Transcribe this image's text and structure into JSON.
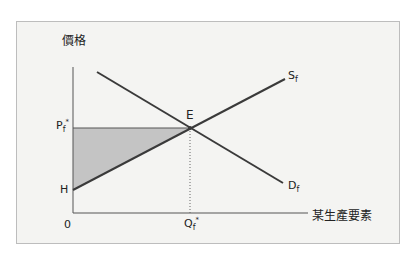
{
  "diagram": {
    "y_axis_label": "價格",
    "x_axis_label": "某生產要素",
    "origin_label": "0",
    "price_label": {
      "main": "P",
      "sub": "f",
      "sup": "*"
    },
    "quantity_label": {
      "main": "Q",
      "sub": "f",
      "sup": "*"
    },
    "intercept_label": "H",
    "equilibrium_label": "E",
    "supply_label": {
      "main": "S",
      "sub": "f"
    },
    "demand_label": {
      "main": "D",
      "sub": "f"
    },
    "colors": {
      "line": "#3a3a3a",
      "shaded": "#c4c4c4",
      "frame_bg": "#f4f4f2",
      "frame_border": "#bdbdbd"
    },
    "geometry": {
      "origin": [
        73,
        213
      ],
      "y_axis_top": [
        73,
        67
      ],
      "x_axis_end": [
        308,
        213
      ],
      "equilibrium": [
        190,
        128
      ],
      "supply_start": [
        73,
        190
      ],
      "supply_end": [
        285,
        79
      ],
      "demand_start": [
        97,
        72
      ],
      "demand_end": [
        283,
        183
      ]
    }
  }
}
